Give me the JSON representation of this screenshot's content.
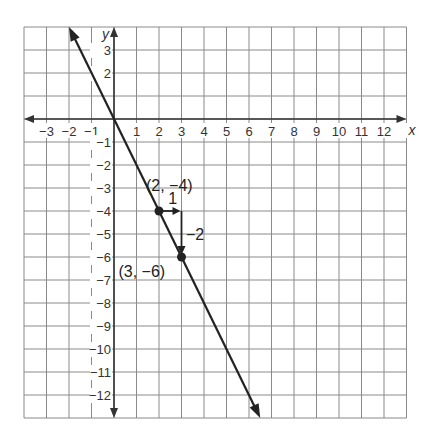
{
  "chart_data": {
    "type": "line",
    "title": "",
    "xlabel": "x",
    "ylabel": "y",
    "xlim": [
      -4,
      13
    ],
    "ylim": [
      -13,
      4
    ],
    "grid": true,
    "x_ticks": [
      "−3",
      "−2",
      "−1",
      "1",
      "2",
      "3",
      "4",
      "5",
      "6",
      "7",
      "8",
      "9",
      "10",
      "11",
      "12"
    ],
    "y_ticks": [
      "3",
      "2",
      "−1",
      "−2",
      "−3",
      "−4",
      "−5",
      "−6",
      "−7",
      "−8",
      "−9",
      "−10",
      "−11",
      "−12"
    ],
    "line": {
      "equation": "y = -2x",
      "slope": -2,
      "intercept": 0,
      "from": [
        -2,
        4
      ],
      "to": [
        6.5,
        -13
      ]
    },
    "points": [
      {
        "x": 2,
        "y": -4,
        "label": "(2, −4)"
      },
      {
        "x": 3,
        "y": -6,
        "label": "(3, −6)"
      }
    ],
    "annotations": [
      {
        "text": "1",
        "meaning": "run"
      },
      {
        "text": "−2",
        "meaning": "rise"
      }
    ]
  }
}
